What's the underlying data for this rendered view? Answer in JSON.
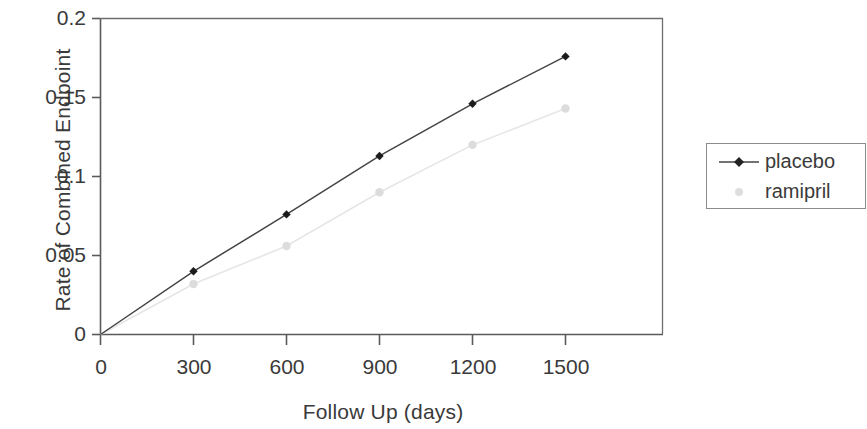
{
  "chart_data": {
    "type": "line",
    "title": "",
    "xlabel": "Follow Up (days)",
    "ylabel": "Rate of Combined Endpoint",
    "x": [
      0,
      300,
      600,
      900,
      1200,
      1500
    ],
    "xticks": [
      "0",
      "300",
      "600",
      "900",
      "1200",
      "1500"
    ],
    "yticks": [
      "0",
      "0.05",
      "0.1",
      "0.15",
      "0.2"
    ],
    "ytick_values": [
      0,
      0.05,
      0.1,
      0.15,
      0.2
    ],
    "xlim": [
      0,
      1800
    ],
    "ylim": [
      0,
      0.2
    ],
    "grid": false,
    "legend_position": "right",
    "series": [
      {
        "name": "placebo",
        "color": "#3a3a3a",
        "marker": "diamond",
        "values": [
          0,
          0.04,
          0.076,
          0.113,
          0.146,
          0.176
        ]
      },
      {
        "name": "ramipril",
        "color": "#e2e2e2",
        "marker": "circle",
        "values": [
          0,
          0.032,
          0.056,
          0.09,
          0.12,
          0.143
        ]
      }
    ]
  },
  "legend": {
    "items": [
      {
        "label": "placebo"
      },
      {
        "label": "ramipril"
      }
    ]
  },
  "axes": {
    "y_title": "Rate of Combined Endpoint",
    "x_title": "Follow Up (days)"
  }
}
